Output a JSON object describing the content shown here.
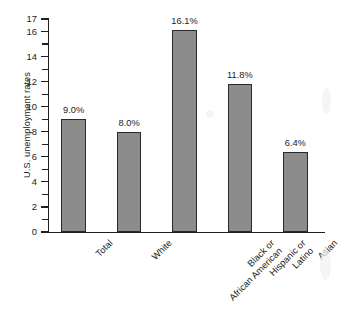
{
  "chart_data": {
    "type": "bar",
    "title": "",
    "xlabel": "",
    "ylabel": "U.S. unemployment rates",
    "ylim": [
      0,
      17
    ],
    "ytick_labels": [
      "0",
      "2",
      "4",
      "6",
      "8",
      "10",
      "12",
      "14",
      "16",
      "17"
    ],
    "ytick_values": [
      0,
      2,
      4,
      6,
      8,
      10,
      12,
      14,
      16,
      17
    ],
    "minor_tick_step": 1,
    "grid": false,
    "legend": "none",
    "bar_fill_color": "#8c8c8c",
    "bar_edge_color": "#2a2a2a",
    "axis_color": "#1f1f1f",
    "background_color": "#ffffff",
    "categories": [
      "Total",
      "White",
      "Black or African American",
      "Hispanic or Latino",
      "Asian"
    ],
    "category_lines": [
      [
        "Total"
      ],
      [
        "White"
      ],
      [
        "Black or",
        "African American"
      ],
      [
        "Hispanic or",
        "Latino"
      ],
      [
        "Asian"
      ]
    ],
    "values": [
      9.0,
      8.0,
      16.1,
      11.8,
      6.4
    ],
    "value_labels": [
      "9.0%",
      "8.0%",
      "16.1%",
      "11.8%",
      "6.4%"
    ]
  }
}
